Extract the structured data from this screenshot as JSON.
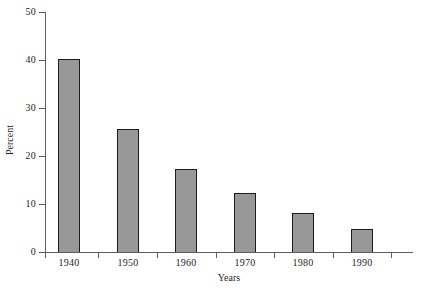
{
  "chart_data": {
    "type": "bar",
    "title": "",
    "subtitle": "",
    "xlabel": "Years",
    "ylabel": "Percent",
    "categories": [
      "1940",
      "1950",
      "1960",
      "1970",
      "1980",
      "1990"
    ],
    "values": [
      40.3,
      25.7,
      17.2,
      12.2,
      8.1,
      4.8
    ],
    "series": [
      {
        "name": "Percent",
        "values": [
          40.3,
          25.7,
          17.2,
          12.2,
          8.1,
          4.8
        ]
      }
    ],
    "ylim": [
      0,
      50
    ],
    "ytick_labels": [
      "0",
      "10",
      "20",
      "30",
      "40",
      "50"
    ],
    "ytick_values": [
      0,
      10,
      20,
      30,
      40,
      50
    ],
    "xtick_labels": [
      "1940",
      "1950",
      "1960",
      "1970",
      "1980",
      "1990"
    ],
    "grid": false,
    "legend": false,
    "legend_position": "none",
    "annotations": [],
    "colors": {
      "bar_fill": "#989898",
      "bar_border": "#1c1c1c",
      "axis": "#5d5d5d",
      "text": "#1f1f1f",
      "background": "#ffffff"
    }
  }
}
